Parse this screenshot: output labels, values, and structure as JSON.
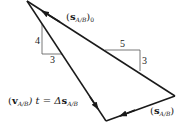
{
  "diagram": {
    "type": "vector triangle",
    "labels": {
      "s_ab_0": {
        "prefix": "(",
        "bold": "s",
        "sub": "A/B",
        "suffix": ")",
        "tail_sub": "0"
      },
      "s_ab": {
        "prefix": "(",
        "bold": "s",
        "sub": "A/B",
        "suffix": ")"
      },
      "v_ab_t": {
        "prefix": "(",
        "bold": "v",
        "sub": "A/B",
        "mid": ") t = Δ",
        "bold2": "s",
        "sub2": "A/B"
      }
    },
    "slope_left": {
      "rise": "4",
      "run": "3"
    },
    "slope_right": {
      "run": "5",
      "rise": "3"
    },
    "colors": {
      "line": "#1a1a1a",
      "thin": "#555555",
      "background": "#ffffff"
    }
  }
}
